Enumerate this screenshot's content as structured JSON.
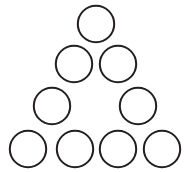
{
  "figure": {
    "name": "triangular-circle-arrangement",
    "background_color": "#ffffff",
    "canvas": {
      "width": 190,
      "height": 172
    },
    "style": {
      "stroke_color": "#231f20",
      "fill_color": "#ffffff",
      "stroke_width": 2,
      "circle_diameter": 38,
      "circle_radius": 18.2
    },
    "total_circles": 9,
    "rows": [
      {
        "row_index": 1,
        "label": "row-1",
        "count": 1,
        "center_y": 24,
        "circles": [
          {
            "label": "circle-r1-c1",
            "cx": 96,
            "cy": 24,
            "r": 18.2
          }
        ]
      },
      {
        "row_index": 2,
        "label": "row-2",
        "count": 2,
        "center_y": 64,
        "circles": [
          {
            "label": "circle-r2-c1",
            "cx": 74,
            "cy": 64,
            "r": 18.2
          },
          {
            "label": "circle-r2-c2",
            "cx": 118,
            "cy": 64,
            "r": 18.2
          }
        ]
      },
      {
        "row_index": 3,
        "label": "row-3",
        "count": 2,
        "center_y": 106,
        "has_center_gap": true,
        "circles": [
          {
            "label": "circle-r3-c1",
            "cx": 52,
            "cy": 106,
            "r": 18.2
          },
          {
            "label": "circle-r3-c2",
            "cx": 138,
            "cy": 106,
            "r": 18.2
          }
        ]
      },
      {
        "row_index": 4,
        "label": "row-4",
        "count": 4,
        "center_y": 149,
        "circles": [
          {
            "label": "circle-r4-c1",
            "cx": 28,
            "cy": 149,
            "r": 18.2
          },
          {
            "label": "circle-r4-c2",
            "cx": 75,
            "cy": 149,
            "r": 18.2
          },
          {
            "label": "circle-r4-c3",
            "cx": 118,
            "cy": 149,
            "r": 18.2
          },
          {
            "label": "circle-r4-c4",
            "cx": 162,
            "cy": 149,
            "r": 18.2
          }
        ]
      }
    ]
  }
}
